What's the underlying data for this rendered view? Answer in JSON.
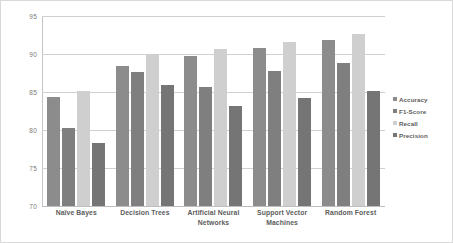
{
  "chart_data": {
    "type": "bar",
    "title": "",
    "subtitle": "",
    "xlabel": "",
    "ylabel": "",
    "ylim": [
      70,
      95
    ],
    "ytick_labels": [
      "95",
      "90",
      "85",
      "80",
      "75",
      "70"
    ],
    "yticks": [
      95,
      90,
      85,
      80,
      75,
      70
    ],
    "grid": true,
    "legend_position": "right",
    "categories": [
      "Naïve Bayes",
      "Decision Trees",
      "Artificial Neural Networks",
      "Support Vector Machines",
      "Random Forest"
    ],
    "series": [
      {
        "name": "Accuracy",
        "color": "#8c8c8c",
        "values": [
          84.3,
          88.4,
          89.7,
          90.8,
          91.8
        ]
      },
      {
        "name": "F1-Score",
        "color": "#7f7f7f",
        "values": [
          80.2,
          87.6,
          85.7,
          87.7,
          88.8
        ]
      },
      {
        "name": "Recall",
        "color": "#cfcfcf",
        "values": [
          85.1,
          90.0,
          90.6,
          91.6,
          92.6
        ]
      },
      {
        "name": "Precision",
        "color": "#757575",
        "values": [
          78.3,
          85.9,
          83.1,
          84.2,
          85.1
        ]
      }
    ]
  },
  "legend": {
    "items": [
      {
        "label": "Accuracy"
      },
      {
        "label": "F1-Score"
      },
      {
        "label": "Recall"
      },
      {
        "label": "Precision"
      }
    ]
  },
  "axis": {
    "y_tick_labels": [
      "95",
      "90",
      "85",
      "80",
      "75",
      "70"
    ],
    "x_tick_labels": [
      "Naïve Bayes",
      "Decision Trees",
      "Artificial Neural Networks",
      "Support Vector Machines",
      "Random Forest"
    ]
  }
}
